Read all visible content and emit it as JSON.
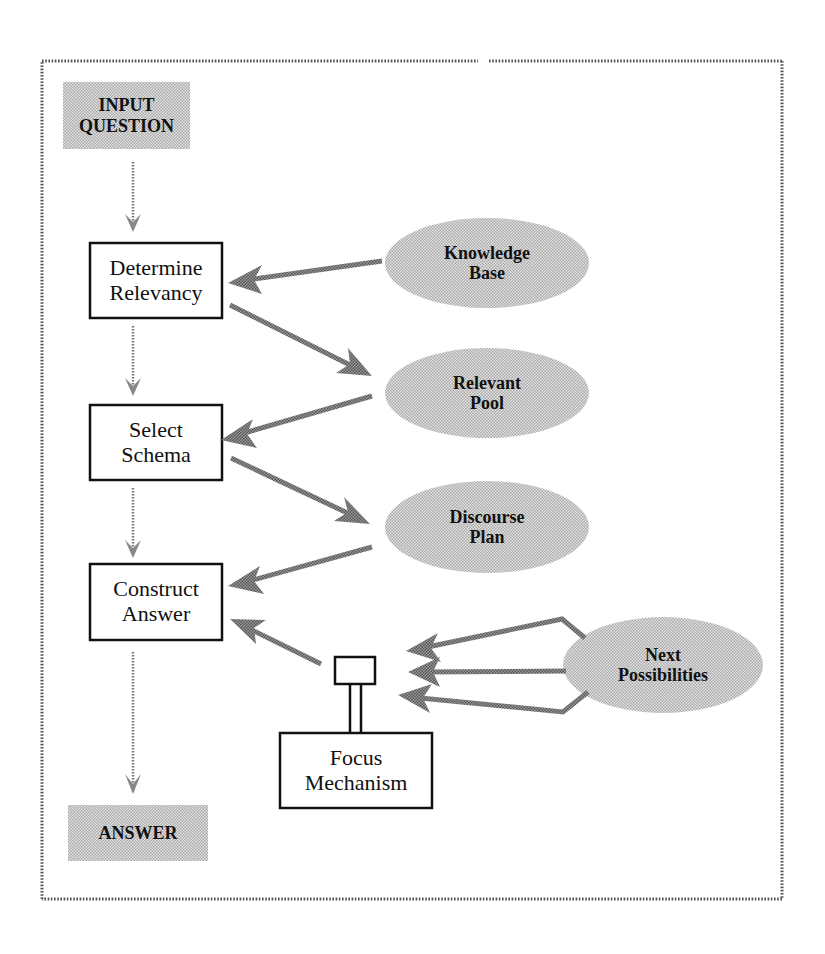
{
  "diagram": {
    "terminals": {
      "input": {
        "line1": "INPUT",
        "line2": "QUESTION"
      },
      "output": {
        "line1": "ANSWER"
      }
    },
    "processes": [
      {
        "id": "determine-relevancy",
        "line1": "Determine",
        "line2": "Relevancy"
      },
      {
        "id": "select-schema",
        "line1": "Select",
        "line2": "Schema"
      },
      {
        "id": "construct-answer",
        "line1": "Construct",
        "line2": "Answer"
      },
      {
        "id": "focus-mechanism",
        "line1": "Focus",
        "line2": "Mechanism"
      }
    ],
    "data_stores": [
      {
        "id": "knowledge-base",
        "line1": "Knowledge",
        "line2": "Base"
      },
      {
        "id": "relevant-pool",
        "line1": "Relevant",
        "line2": "Pool"
      },
      {
        "id": "discourse-plan",
        "line1": "Discourse",
        "line2": "Plan"
      },
      {
        "id": "next-possibilities",
        "line1": "Next",
        "line2": "Possibilities"
      }
    ],
    "edges": [
      {
        "from": "INPUT QUESTION",
        "to": "Determine Relevancy"
      },
      {
        "from": "Knowledge Base",
        "to": "Determine Relevancy"
      },
      {
        "from": "Determine Relevancy",
        "to": "Relevant Pool"
      },
      {
        "from": "Determine Relevancy",
        "to": "Select Schema"
      },
      {
        "from": "Relevant Pool",
        "to": "Select Schema"
      },
      {
        "from": "Select Schema",
        "to": "Discourse Plan"
      },
      {
        "from": "Select Schema",
        "to": "Construct Answer"
      },
      {
        "from": "Discourse Plan",
        "to": "Construct Answer"
      },
      {
        "from": "Focus Mechanism",
        "to": "Construct Answer"
      },
      {
        "from": "Next Possibilities",
        "to": "Focus Mechanism",
        "count": 3
      },
      {
        "from": "Construct Answer",
        "to": "ANSWER"
      }
    ],
    "colors": {
      "shade": "#c8c8c8",
      "arrow": "#8a8a8a",
      "thin_arrow": "#777777",
      "border_dots": "#555555",
      "stroke": "#111111"
    }
  }
}
